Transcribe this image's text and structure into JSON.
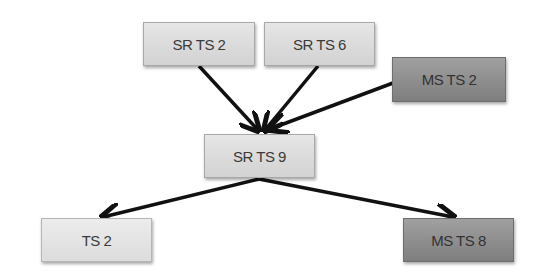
{
  "diagram": {
    "nodes": [
      {
        "id": "srts2",
        "label": "SR TS 2",
        "shade": "light"
      },
      {
        "id": "srts6",
        "label": "SR TS 6",
        "shade": "light"
      },
      {
        "id": "msts2",
        "label": "MS TS 2",
        "shade": "dark"
      },
      {
        "id": "srts9",
        "label": "SR TS 9",
        "shade": "light"
      },
      {
        "id": "ts2",
        "label": "TS 2",
        "shade": "lighter"
      },
      {
        "id": "msts8",
        "label": "MS TS 8",
        "shade": "dark"
      }
    ],
    "edges": [
      {
        "from": "srts2",
        "to": "srts9"
      },
      {
        "from": "srts6",
        "to": "srts9"
      },
      {
        "from": "msts2",
        "to": "srts9"
      },
      {
        "from": "srts9",
        "to": "ts2"
      },
      {
        "from": "srts9",
        "to": "msts8"
      }
    ],
    "colors": {
      "arrow": "#111111",
      "light_box": "#dcdcdc",
      "dark_box": "#8c8c8c"
    }
  }
}
